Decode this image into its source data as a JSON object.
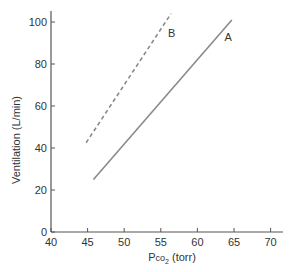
{
  "chart_data": {
    "type": "line",
    "title": "",
    "xlabel": "Pco2 (torr)",
    "xlabel_main": "P",
    "xlabel_sub_pre": "co",
    "xlabel_sub": "2",
    "xlabel_post": " (torr)",
    "ylabel": "Ventilation (L/min)",
    "xlim": [
      40,
      72
    ],
    "ylim": [
      0,
      105
    ],
    "xticks": [
      40,
      45,
      50,
      55,
      60,
      65,
      70
    ],
    "yticks": [
      0,
      20,
      40,
      60,
      80,
      100
    ],
    "grid": false,
    "legend": "inline labels",
    "series": [
      {
        "name": "A",
        "style": "solid",
        "color": "#8a8a8a",
        "x": [
          45.8,
          64.7
        ],
        "y": [
          25,
          101
        ],
        "label_pos": [
          64.2,
          91
        ]
      },
      {
        "name": "B",
        "style": "dashed",
        "color": "#8a8a8a",
        "x": [
          44.8,
          56.4
        ],
        "y": [
          42.5,
          104
        ],
        "label_pos": [
          56.5,
          93
        ]
      }
    ]
  }
}
